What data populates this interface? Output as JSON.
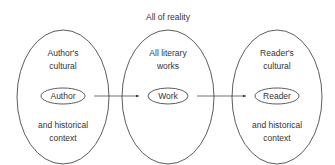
{
  "title": "All of reality",
  "circles": [
    {
      "top1": "Author's",
      "top2": "cultural",
      "node": "Author",
      "bottom1": "and historical",
      "bottom2": "context"
    },
    {
      "top1": "All literary",
      "top2": "works",
      "node": "Work",
      "bottom1": "",
      "bottom2": ""
    },
    {
      "top1": "Reader's",
      "top2": "cultural",
      "node": "Reader",
      "bottom1": "and historical",
      "bottom2": "context"
    }
  ]
}
